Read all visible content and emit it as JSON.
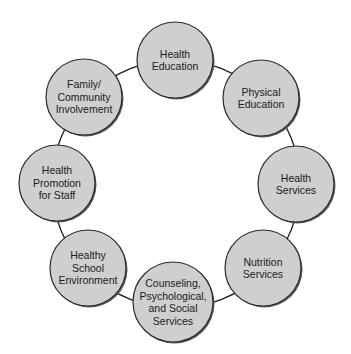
{
  "diagram": {
    "type": "cycle",
    "title": "",
    "ring": {
      "cx": 176,
      "cy": 184,
      "r": 124
    },
    "colors": {
      "node_fill": "#cfcfcf",
      "node_stroke": "#2a2a2a",
      "ring_stroke": "#1e1e1e",
      "text": "#1a1a1a",
      "background": "#ffffff"
    },
    "nodes": [
      {
        "id": "health-education",
        "lines": [
          "Health",
          "Education"
        ],
        "cx": 175,
        "cy": 60,
        "r": 38
      },
      {
        "id": "physical-education",
        "lines": [
          "Physical",
          "Education"
        ],
        "cx": 261,
        "cy": 98,
        "r": 38
      },
      {
        "id": "health-services",
        "lines": [
          "Health",
          "Services"
        ],
        "cx": 296,
        "cy": 184,
        "r": 38
      },
      {
        "id": "nutrition-services",
        "lines": [
          "Nutrition",
          "Services"
        ],
        "cx": 263,
        "cy": 268,
        "r": 38
      },
      {
        "id": "counseling-psychological-social-services",
        "lines": [
          "Counseling,",
          "Psychological,",
          "and Social",
          "Services"
        ],
        "cx": 173,
        "cy": 302,
        "r": 40
      },
      {
        "id": "healthy-school-environment",
        "lines": [
          "Healthy",
          "School",
          "Environment"
        ],
        "cx": 88,
        "cy": 268,
        "r": 38
      },
      {
        "id": "health-promotion-for-staff",
        "lines": [
          "Health",
          "Promotion",
          "for Staff"
        ],
        "cx": 57,
        "cy": 183,
        "r": 38
      },
      {
        "id": "family-community-involvement",
        "lines": [
          "Family/",
          "Community",
          "Involvement"
        ],
        "cx": 84,
        "cy": 97,
        "r": 38
      }
    ]
  }
}
